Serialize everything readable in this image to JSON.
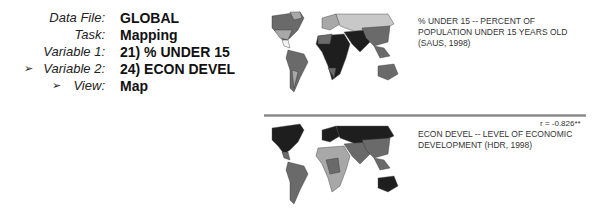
{
  "settings": {
    "rows": [
      {
        "label": "Data File:",
        "value": "GLOBAL",
        "arrow": false
      },
      {
        "label": "Task:",
        "value": "Mapping",
        "arrow": false
      },
      {
        "label": "Variable 1:",
        "value": "21) % UNDER 15",
        "arrow": false
      },
      {
        "label": "Variable 2:",
        "value": "24) ECON DEVEL",
        "arrow": true
      },
      {
        "label": "View:",
        "value": "Map",
        "arrow": true
      }
    ],
    "arrow_glyph": "➢"
  },
  "maps": {
    "top": {
      "caption_line1": "% UNDER 15 -- PERCENT OF",
      "caption_line2": "POPULATION UNDER 15 YEARS OLD",
      "caption_line3": "(SAUS, 1998)"
    },
    "bottom": {
      "correlation": "r = -0.826**",
      "caption_line1": "ECON DEVEL -- LEVEL  OF ECONOMIC",
      "caption_line2": "DEVELOPMENT (HDR, 1998)"
    }
  },
  "colors": {
    "dark": "#1e1e1e",
    "mid": "#6a6a6a",
    "light": "#a8a8a8",
    "pale": "#d4d4d4"
  }
}
